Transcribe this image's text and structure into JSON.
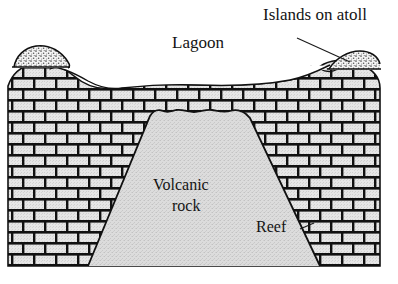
{
  "figure": {
    "title_alt": "Cross-section of a coral atoll",
    "labels": {
      "lagoon": "Lagoon",
      "islands_on_atoll": "Islands on atoll",
      "volcanic_line1": "Volcanic",
      "volcanic_line2": "rock",
      "reef": "Reef"
    },
    "colors": {
      "background": "#ffffff",
      "brick_fill": "#e2e2e2",
      "brick_mortar": "#111111",
      "volcanic_fill": "#d9d9d9",
      "island_fill": "#f0f0f0",
      "outline": "#111111",
      "text": "#141414"
    },
    "parts": [
      {
        "name": "reef",
        "material": "coral limestone brickwork"
      },
      {
        "name": "volcanic-rock",
        "material": "stippled volcanic core"
      },
      {
        "name": "lagoon",
        "material": "water"
      },
      {
        "name": "island-left",
        "material": "sand"
      },
      {
        "name": "island-right",
        "material": "sand"
      }
    ]
  }
}
